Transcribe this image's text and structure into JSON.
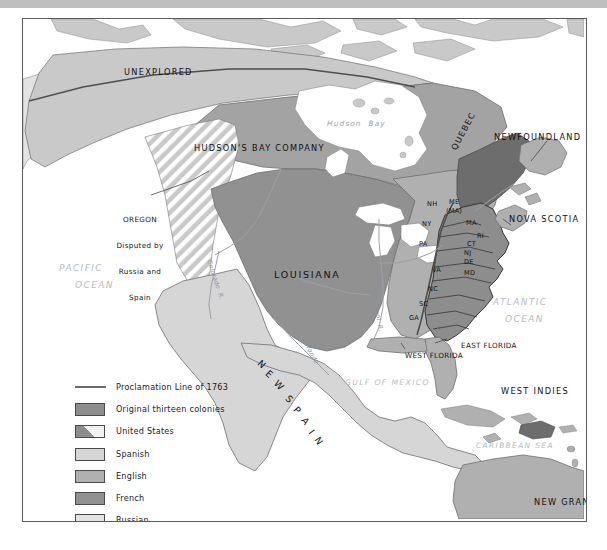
{
  "map": {
    "title": "North America in 1763",
    "frame": {
      "x": 22,
      "y": 18,
      "width": 563,
      "height": 502
    },
    "colors": {
      "ocean": "#ffffff",
      "border": "#5a5a5a",
      "topbar": "#bfbfbf",
      "original_thirteen_colonies": "#8d8d8d",
      "united_states": "#8d8d8d",
      "spanish": "#d6d6d6",
      "english": "#b0b0b0",
      "french": "#919191",
      "russian": "#e3e3e3",
      "unexplored": "#c9c9c9",
      "hudsons_bay": "#a3a3a3",
      "proclamation_line": "#5e5e5e",
      "water_label": "#b6bcc2",
      "coastline": "#6f6f6f"
    },
    "regions": [
      {
        "name": "UNEXPLORED",
        "x": 123,
        "y": 66,
        "class": "region-med"
      },
      {
        "name": "HUDSON'S BAY COMPANY",
        "x": 193,
        "y": 142,
        "class": "region-med"
      },
      {
        "name": "LOUISIANA",
        "x": 273,
        "y": 268,
        "class": "region-big"
      },
      {
        "name": "QUEBEC",
        "x": 455,
        "y": 148,
        "class": "region-med",
        "rotate": -62
      },
      {
        "name": "NEW SPAIN",
        "x": 258,
        "y": 368,
        "class": "region-big",
        "curved": true
      },
      {
        "name": "NEW GRANADA",
        "x": 520,
        "y": 489,
        "class": "region-med"
      },
      {
        "name": "WEST FLORIDA",
        "x": 392,
        "y": 341,
        "class": "callout"
      },
      {
        "name": "EAST FLORIDA",
        "x": 446,
        "y": 331,
        "class": "callout"
      },
      {
        "name": "NEWFOUNDLAND",
        "x": 493,
        "y": 131,
        "class": "region-med"
      },
      {
        "name": "NOVA SCOTIA",
        "x": 508,
        "y": 213,
        "class": "region-med"
      },
      {
        "name": "WEST INDIES",
        "x": 500,
        "y": 385,
        "class": "region-med"
      }
    ],
    "water_labels": [
      {
        "name": "PACIFIC",
        "x": 58,
        "y": 262
      },
      {
        "name": "OCEAN",
        "x": 74,
        "y": 279
      },
      {
        "name": "ATLANTIC",
        "x": 492,
        "y": 296
      },
      {
        "name": "OCEAN",
        "x": 504,
        "y": 313
      },
      {
        "name": "GULF OF MEXICO",
        "x": 344,
        "y": 377
      },
      {
        "name": "CARIBBEAN SEA",
        "x": 475,
        "y": 440
      },
      {
        "name": "Hudson  Bay",
        "x": 326,
        "y": 118
      }
    ],
    "rivers": [
      {
        "name": "Missouri  R.",
        "x": 246,
        "y": 186,
        "rotate": 68
      },
      {
        "name": "Colorado  R.",
        "x": 212,
        "y": 258,
        "rotate": 72
      },
      {
        "name": "Mississippi  R.",
        "x": 375,
        "y": 283,
        "rotate": 79
      },
      {
        "name": "Ohio R.",
        "x": 333,
        "y": 248,
        "rotate": 8
      },
      {
        "name": "Rio",
        "x": 290,
        "y": 330,
        "rotate": 14
      },
      {
        "name": "Grande",
        "x": 308,
        "y": 339,
        "rotate": 62
      }
    ],
    "oregon_callout": {
      "lines": [
        "OREGON",
        "Disputed by",
        "Russia and",
        "Spain"
      ],
      "x": 117,
      "y": 198
    },
    "colonies": [
      {
        "abbr": "NH",
        "x": 433,
        "y": 203
      },
      {
        "abbr": "ME",
        "x": 455,
        "y": 201
      },
      {
        "abbr": "(MA)",
        "x": 452,
        "y": 210
      },
      {
        "abbr": "NY",
        "x": 428,
        "y": 223
      },
      {
        "abbr": "MA",
        "x": 472,
        "y": 222
      },
      {
        "abbr": "CT",
        "x": 473,
        "y": 243
      },
      {
        "abbr": "RI",
        "x": 483,
        "y": 235
      },
      {
        "abbr": "PA",
        "x": 425,
        "y": 243
      },
      {
        "abbr": "NJ",
        "x": 470,
        "y": 252
      },
      {
        "abbr": "DE",
        "x": 470,
        "y": 261
      },
      {
        "abbr": "VA",
        "x": 438,
        "y": 269
      },
      {
        "abbr": "MD",
        "x": 470,
        "y": 272
      },
      {
        "abbr": "NC",
        "x": 434,
        "y": 288
      },
      {
        "abbr": "SC",
        "x": 425,
        "y": 303
      },
      {
        "abbr": "GA",
        "x": 415,
        "y": 317
      }
    ]
  },
  "legend": {
    "items": [
      {
        "label": "Proclamation Line of 1763",
        "swatch": "line",
        "color": "#6b6b6b"
      },
      {
        "label": "Original thirteen colonies",
        "swatch": "solid",
        "color": "#8d8d8d"
      },
      {
        "label": "United States",
        "swatch": "hatch",
        "color": "#8d8d8d"
      },
      {
        "label": "Spanish",
        "swatch": "solid",
        "color": "#d6d6d6"
      },
      {
        "label": "English",
        "swatch": "solid",
        "color": "#b0b0b0"
      },
      {
        "label": "French",
        "swatch": "solid",
        "color": "#919191"
      },
      {
        "label": "Russian",
        "swatch": "solid",
        "color": "#e3e3e3"
      }
    ]
  }
}
